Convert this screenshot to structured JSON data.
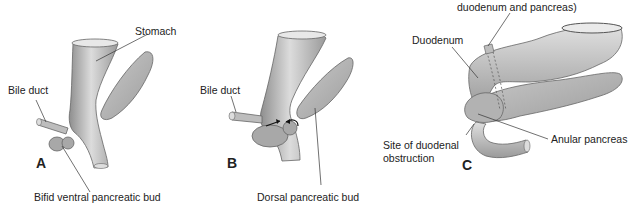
{
  "figure": {
    "panels": [
      {
        "letter": "A",
        "labels": {
          "stomach": "Stomach",
          "bile_duct": "Bile duct",
          "bottom": "Bifid ventral pancreatic bud"
        }
      },
      {
        "letter": "B",
        "labels": {
          "bile_duct": "Bile duct",
          "bottom": "Dorsal pancreatic bud"
        }
      },
      {
        "letter": "C",
        "labels": {
          "top": "duodenum and pancreas)",
          "duodenum": "Duodenum",
          "site_line1": "Site of duodenal",
          "site_line2": "obstruction",
          "anular": "Anular pancreas"
        }
      }
    ],
    "colors": {
      "organ_fill": "#b8b8b8",
      "organ_light": "#d9d9d9",
      "organ_stroke": "#666666",
      "leader_line": "#333333",
      "text": "#222222"
    }
  }
}
